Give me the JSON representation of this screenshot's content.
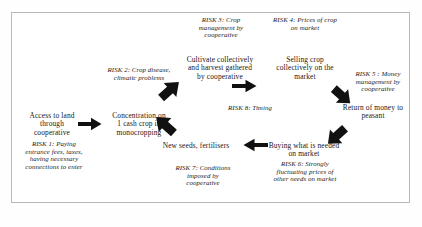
{
  "diagram": {
    "type": "flow-cycle",
    "border_color": "#b9b9b9",
    "background_color": "#ffffff",
    "text_color": "#171717",
    "risk_text_color": "#232323",
    "nodes": [
      {
        "id": "access",
        "label": "Access to land\nthrough\ncooperative"
      },
      {
        "id": "concentration",
        "label": "Concentration on\n1 cash crop in\nmonocropping"
      },
      {
        "id": "cultivate",
        "label": "Cultivate collectively\nand harvest gathered\nby cooperative"
      },
      {
        "id": "selling",
        "label": "Selling crop\ncollectively on the\nmarket"
      },
      {
        "id": "return",
        "label": "Return of money to\npeasant"
      },
      {
        "id": "buying",
        "label": "Buying what is needed\non market"
      },
      {
        "id": "seeds",
        "label": "New seeds, fertilisers"
      }
    ],
    "risks": [
      {
        "id": "risk1",
        "label": "RISK 1: Paying\nentrance fees, taxes,\nhaving necessary\nconnections to enter"
      },
      {
        "id": "risk2",
        "label": "RISK 2: Crop disease,\nclimatic problems"
      },
      {
        "id": "risk3",
        "label": "RISK 3: Crop\nmanagement by\ncooperative"
      },
      {
        "id": "risk4",
        "label": "RISK 4: Prices of crop\non market"
      },
      {
        "id": "risk5",
        "label": "RISK 5 : Money\nmanagement by\ncooperative"
      },
      {
        "id": "risk6",
        "label": "RISK 6: Strongly\nfluctuating prices of\nother needs on market"
      },
      {
        "id": "risk7",
        "label": "RISK 7: Conditions\nimposed by\ncooperative"
      },
      {
        "id": "risk8",
        "label": "RISK 8: Timing"
      }
    ],
    "arrows": [
      {
        "id": "arrow-access-to-concentration",
        "direction": "right"
      },
      {
        "id": "arrow-concentration-to-cultivate",
        "direction": "up-right"
      },
      {
        "id": "arrow-cultivate-to-selling",
        "direction": "right"
      },
      {
        "id": "arrow-selling-to-return",
        "direction": "down-right"
      },
      {
        "id": "arrow-return-to-buying",
        "direction": "down-left"
      },
      {
        "id": "arrow-buying-to-seeds",
        "direction": "left"
      },
      {
        "id": "arrow-seeds-to-concentration",
        "direction": "up-left"
      }
    ]
  }
}
